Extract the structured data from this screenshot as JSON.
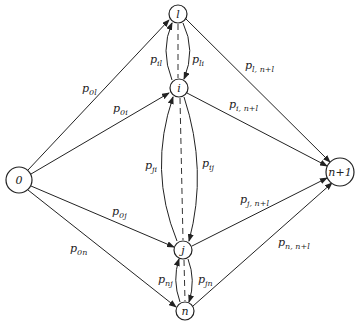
{
  "diagram": {
    "type": "directed-graph",
    "nodes": {
      "source": {
        "label": "0"
      },
      "l": {
        "label": "l"
      },
      "i": {
        "label": "i"
      },
      "j": {
        "label": "j"
      },
      "n": {
        "label": "n"
      },
      "sink": {
        "label": "n+1"
      }
    },
    "edges": {
      "p0l": {
        "base": "p",
        "sub": "0l"
      },
      "p0i": {
        "base": "p",
        "sub": "0i"
      },
      "p0j": {
        "base": "p",
        "sub": "0j"
      },
      "p0n": {
        "base": "p",
        "sub": "0n"
      },
      "pil": {
        "base": "p",
        "sub": "il"
      },
      "pli": {
        "base": "p",
        "sub": "li"
      },
      "pji": {
        "base": "p",
        "sub": "ji"
      },
      "pij": {
        "base": "p",
        "sub": "ij"
      },
      "pnj": {
        "base": "p",
        "sub": "nj"
      },
      "pjn": {
        "base": "p",
        "sub": "jn"
      },
      "pl_n1": {
        "base": "p",
        "sub": "l, n+l"
      },
      "pi_n1": {
        "base": "p",
        "sub": "i, n+l"
      },
      "pj_n1": {
        "base": "p",
        "sub": "j, n+l"
      },
      "pn_n1": {
        "base": "p",
        "sub": "n, n+l"
      }
    }
  }
}
